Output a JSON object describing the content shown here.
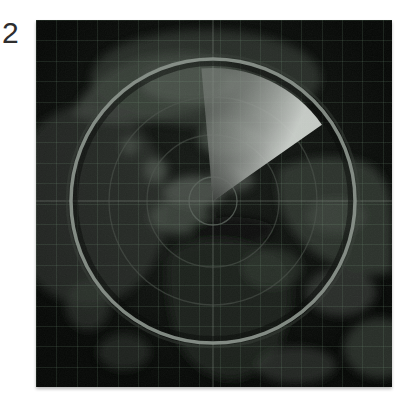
{
  "figure": {
    "label": "2"
  },
  "radar": {
    "description": "radar sweep display over dark world map",
    "colors": {
      "page_bg": "#ffffff",
      "panel_bg": "#0d100d",
      "grid_line": "rgba(115,150,122,0.17)",
      "outer_ring": "#8a938b",
      "outer_ring_glow": "#39413a",
      "ring_shadow": "#060806",
      "inner_ring": "#4e564f",
      "inner_circle": "#5d655e",
      "crosshair": "#9aa59b",
      "sweep_trailing": "rgba(128,133,128,0.55)",
      "sweep_mid": "rgba(176,181,176,0.82)",
      "sweep_leading": "rgba(208,213,208,0.95)",
      "land": "#353c35",
      "land_bright": "#575e57",
      "land_dark": "#1f231f"
    },
    "center": {
      "x": 177,
      "y": 181
    },
    "rings": [
      {
        "name": "inner-circle",
        "r": 24
      },
      {
        "name": "ring-2",
        "r": 66
      },
      {
        "name": "ring-3",
        "r": 104
      },
      {
        "name": "outer-ring",
        "r": 142
      }
    ],
    "sweep": {
      "start_angle_deg": -5,
      "end_angle_deg": 55,
      "radius": 133
    }
  }
}
